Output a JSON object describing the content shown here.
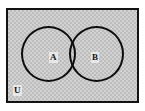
{
  "diagram": {
    "type": "venn",
    "universe": {
      "label": "U",
      "name": "universal-set",
      "fill": "#d2d2d2",
      "stroke": "#121212"
    },
    "sets": [
      {
        "label": "A",
        "name": "set-a",
        "position": "left",
        "stroke": "#0d0d0d",
        "fill": "transparent"
      },
      {
        "label": "B",
        "name": "set-b",
        "position": "right",
        "stroke": "#0d0d0d",
        "fill": "transparent"
      }
    ],
    "regions": {
      "intersection_shaded": false,
      "union_shaded": false,
      "background_texture": "dithered-gray"
    },
    "colors": {
      "canvas": "#ffffff",
      "outline": "#0d0d0d",
      "universe_fill": "#d2d2d2",
      "label_patch": "#e8e8e8"
    }
  }
}
